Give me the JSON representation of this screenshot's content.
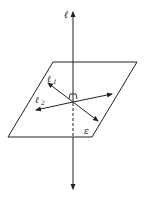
{
  "diagram": {
    "labels": {
      "line": "ℓ",
      "line1": "ℓ",
      "line1_sub": "1",
      "line2": "ℓ",
      "line2_sub": "2",
      "plane": "ε"
    },
    "colors": {
      "stroke": "#222222",
      "background": "#ffffff"
    }
  }
}
